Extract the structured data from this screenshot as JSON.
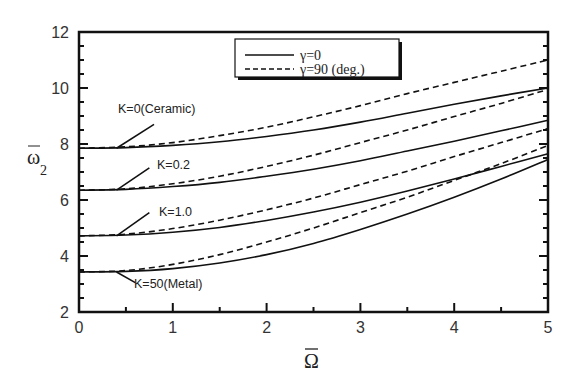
{
  "chart_data": {
    "type": "line",
    "title": "",
    "xlabel": "Ω̄",
    "ylabel": "ω̄₂",
    "xlim": [
      0,
      5
    ],
    "ylim": [
      2,
      12
    ],
    "xticks": [
      0,
      1,
      2,
      3,
      4,
      5
    ],
    "yticks": [
      2,
      4,
      6,
      8,
      10,
      12
    ],
    "x_minor_step": 0.5,
    "y_minor_step": 0.5,
    "grid": false,
    "legend": {
      "position": "top-center",
      "entries": [
        {
          "label": "γ=0",
          "style": "solid"
        },
        {
          "label": "γ=90 (deg.)",
          "style": "dashed"
        }
      ]
    },
    "x": [
      0,
      0.5,
      1,
      1.5,
      2,
      2.5,
      3,
      3.5,
      4,
      4.5,
      5
    ],
    "series": [
      {
        "name": "K=0 (Ceramic), γ=0",
        "style": "solid",
        "values": [
          7.85,
          7.87,
          7.95,
          8.08,
          8.27,
          8.5,
          8.78,
          9.1,
          9.42,
          9.72,
          10.0
        ]
      },
      {
        "name": "K=0 (Ceramic), γ=90",
        "style": "dashed",
        "values": [
          7.85,
          7.9,
          8.05,
          8.3,
          8.6,
          8.97,
          9.37,
          9.8,
          10.2,
          10.6,
          11.0
        ]
      },
      {
        "name": "K=0.2, γ=0",
        "style": "solid",
        "values": [
          6.35,
          6.38,
          6.48,
          6.63,
          6.85,
          7.1,
          7.4,
          7.75,
          8.1,
          8.47,
          8.85
        ]
      },
      {
        "name": "K=0.2, γ=90",
        "style": "dashed",
        "values": [
          6.35,
          6.4,
          6.58,
          6.85,
          7.2,
          7.6,
          8.05,
          8.5,
          8.98,
          9.45,
          9.95
        ]
      },
      {
        "name": "K=1.0, γ=0",
        "style": "solid",
        "values": [
          4.72,
          4.75,
          4.85,
          5.02,
          5.27,
          5.57,
          5.92,
          6.32,
          6.75,
          7.2,
          7.65
        ]
      },
      {
        "name": "K=1.0, γ=90",
        "style": "dashed",
        "values": [
          4.72,
          4.78,
          4.98,
          5.28,
          5.65,
          6.07,
          6.55,
          7.03,
          7.55,
          8.05,
          8.55
        ]
      },
      {
        "name": "K=50 (Metal), γ=0",
        "style": "solid",
        "values": [
          3.43,
          3.45,
          3.55,
          3.75,
          4.05,
          4.45,
          4.95,
          5.5,
          6.1,
          6.75,
          7.45
        ]
      },
      {
        "name": "K=50 (Metal), γ=90",
        "style": "dashed",
        "values": [
          3.43,
          3.48,
          3.7,
          4.05,
          4.5,
          5.0,
          5.55,
          6.1,
          6.7,
          7.3,
          7.95
        ]
      }
    ],
    "annotations": [
      {
        "text": "K=0(Ceramic)",
        "pointer_from": [
          0.4,
          7.85
        ],
        "pointer_to": [
          0.8,
          8.7
        ]
      },
      {
        "text": "K=0.2",
        "pointer_from": [
          0.4,
          6.35
        ],
        "pointer_to": [
          0.75,
          7.15
        ]
      },
      {
        "text": "K=1.0",
        "pointer_from": [
          0.4,
          4.72
        ],
        "pointer_to": [
          0.75,
          5.55
        ]
      },
      {
        "text": "K=50(Metal)",
        "pointer_from": [
          0.4,
          3.43
        ],
        "pointer_to": [
          0.6,
          3.05
        ]
      }
    ]
  },
  "labels": {
    "x_axis_title": "Ω",
    "y_axis_title_main": "ω",
    "y_axis_title_sub": "2",
    "legend_solid": "γ=0",
    "legend_dashed": "γ=90 (deg.)",
    "ann_k0": "K=0(Ceramic)",
    "ann_k02": "K=0.2",
    "ann_k1": "K=1.0",
    "ann_k50": "K=50(Metal)"
  }
}
